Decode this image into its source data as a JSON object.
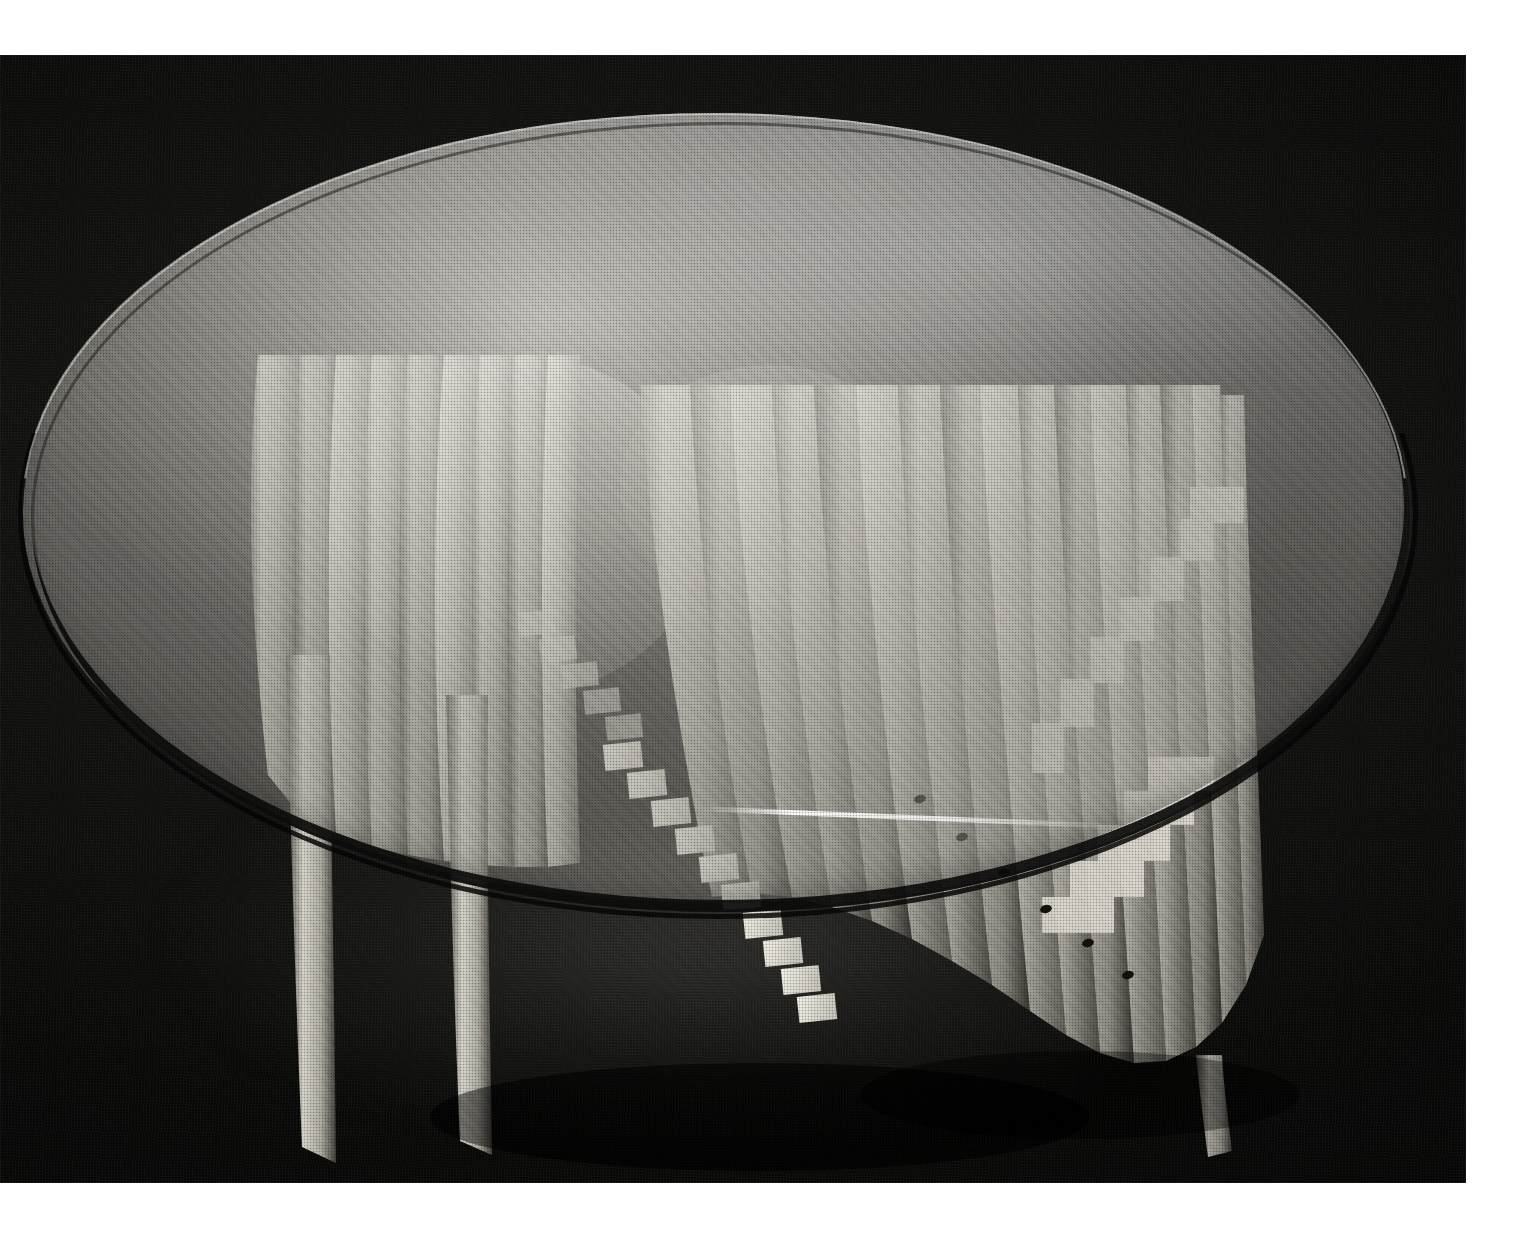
{
  "page": {
    "background_color": "#ffffff",
    "width": 1527,
    "height": 1245,
    "clipped_top_text": "",
    "caption": ""
  },
  "plate": {
    "label": "photographic-plate",
    "x": 0,
    "y": 55,
    "width": 1466,
    "height": 1128,
    "medium": "halftone-screened black-and-white photograph",
    "background_color": "#0d0d0c",
    "backdrop_description": "dark seamless cloth backdrop, slight vignette, visible weave grain"
  },
  "subject": {
    "name": "sculptural glass-top table",
    "description": "A round glass-topped table resting on a sculpted base built from many thin radiating laminated wood fins that flare outward like a fan or shell, with a stepped staircase-like inner edge and tapering legs reaching the floor.",
    "materials": [
      "glass",
      "laminated wood"
    ],
    "lighting": "single soft key light from upper left, dark field"
  },
  "glass_top": {
    "name": "glass-tabletop",
    "shape": "ellipse (round top seen in perspective)",
    "center_x": 713,
    "center_y": 453,
    "radius_x": 691,
    "radius_y": 395,
    "surface_tone": "#cdcbc4",
    "highlight_tone": "#ecebe4",
    "edge_tone": "#101010",
    "transparency": "semi-transparent — base structure visible through the glass",
    "edge_thickness_px": 14
  },
  "base": {
    "name": "fanned-fin-base",
    "fin_count": 34,
    "fin_tone_light": "#d8d5cb",
    "fin_tone_mid": "#a9a69c",
    "fin_tone_shadow": "#4d4b45",
    "features": [
      "radiating thin vertical fins forming a flared shell",
      "stepped staircase profile at the centre",
      "two tapering legs touching the floor at lower left and lower centre",
      "small dark peg holes in a diagonal line across the right fan"
    ],
    "leg_left": {
      "x": 300,
      "y_top": 600,
      "y_bottom": 1105
    },
    "leg_center": {
      "x": 468,
      "y_top": 640,
      "y_bottom": 1100
    },
    "fan_right_extent_x": 1260,
    "fan_bottom_y": 1060
  },
  "colors": {
    "page_white": "#ffffff",
    "field_black": "#0d0d0c",
    "wood_highlight": "#e2dfd5",
    "wood_mid": "#a9a69c",
    "wood_shadow": "#4d4b45",
    "glass_grey": "#cdcbc4"
  }
}
